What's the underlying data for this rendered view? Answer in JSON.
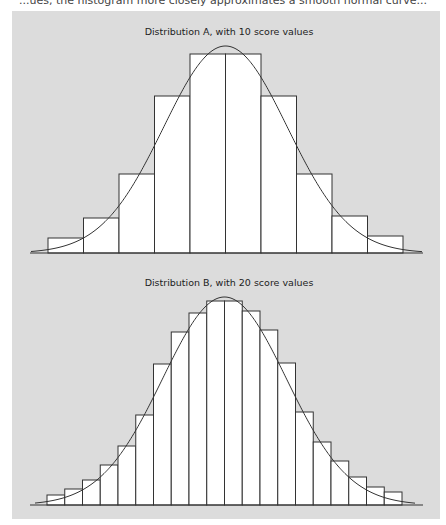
{
  "caption_fragment": "...ues, the histogram more closely approximates a smooth normal curve...",
  "colors": {
    "panel": "#dcdcdc",
    "bar_fill": "#ffffff",
    "stroke": "#333333"
  },
  "chart_data": [
    {
      "type": "bar",
      "title": "Distribution A, with 10 score values",
      "categories": [
        "1",
        "2",
        "3",
        "4",
        "5",
        "6",
        "7",
        "8",
        "9",
        "10"
      ],
      "values": [
        15,
        35,
        79,
        157,
        199,
        199,
        157,
        79,
        37,
        17
      ],
      "overlay": "normal curve",
      "xlabel": "",
      "ylabel": "",
      "grid": false
    },
    {
      "type": "bar",
      "title": "Distribution B, with 20 score values",
      "categories": [
        "1",
        "2",
        "3",
        "4",
        "5",
        "6",
        "7",
        "8",
        "9",
        "10",
        "11",
        "12",
        "13",
        "14",
        "15",
        "16",
        "17",
        "18",
        "19",
        "20"
      ],
      "values": [
        10,
        16,
        25,
        40,
        59,
        90,
        141,
        173,
        192,
        204,
        204,
        194,
        175,
        142,
        93,
        63,
        44,
        28,
        18,
        13
      ],
      "overlay": "normal curve",
      "xlabel": "",
      "ylabel": "",
      "grid": false
    }
  ]
}
